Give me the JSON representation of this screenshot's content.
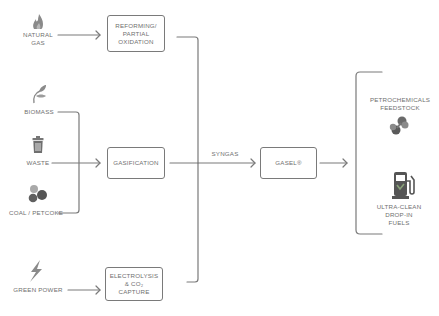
{
  "inputs": [
    {
      "id": "natural_gas",
      "label_line1": "NATURAL",
      "label_line2": "GAS",
      "icon": "flame-icon"
    },
    {
      "id": "biomass",
      "label": "BIOMASS",
      "icon": "leaf-icon"
    },
    {
      "id": "waste",
      "label": "WASTE",
      "icon": "trash-can-icon"
    },
    {
      "id": "coal",
      "label": "COAL / PETCOKE",
      "icon": "coal-lumps-icon"
    },
    {
      "id": "green_power",
      "label": "GREEN POWER",
      "icon": "lightning-bolt-icon"
    }
  ],
  "processes": {
    "reforming": {
      "line1": "REFORMING/",
      "line2": "PARTIAL",
      "line3": "OXIDATION"
    },
    "gasification": {
      "line1": "GASIFICATION"
    },
    "electrolysis": {
      "line1": "ELECTROLYSIS",
      "line2": "& CO₂",
      "line3": "CAPTURE"
    }
  },
  "intermediate": {
    "syngas_label": "SYNGAS"
  },
  "core": {
    "label": "GASEL®"
  },
  "outputs": [
    {
      "id": "petrochemicals",
      "line1": "PETROCHEMICALS",
      "line2": "FEEDSTOCK",
      "icon": "molecule-icon"
    },
    {
      "id": "fuels",
      "line1": "ULTRA-CLEAN",
      "line2": "DROP-IN",
      "line3": "FUELS",
      "icon": "fuel-pump-icon"
    }
  ],
  "colors": {
    "line": "#7a7a7a",
    "icon": "#8a8a8a",
    "icon_dark": "#5f5f5f",
    "accent_green": "#8aa37a"
  }
}
